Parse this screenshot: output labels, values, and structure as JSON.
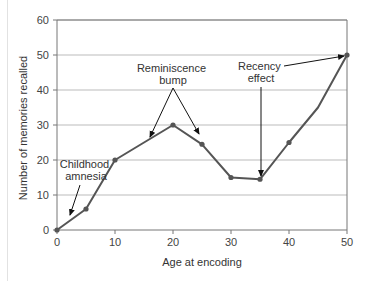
{
  "chart_data": {
    "type": "line",
    "title": "",
    "xlabel": "Age at encoding",
    "ylabel": "Number of memories recalled",
    "x": [
      0,
      5,
      10,
      15,
      20,
      25,
      30,
      35,
      40,
      45,
      50
    ],
    "series": [
      {
        "name": "Memories recalled",
        "values": [
          0,
          6,
          20,
          25,
          30,
          24.5,
          15,
          14.5,
          25,
          35,
          50
        ],
        "markers_at": [
          0,
          5,
          10,
          20,
          25,
          30,
          35,
          40,
          50
        ]
      }
    ],
    "xlim": [
      0,
      50
    ],
    "ylim": [
      0,
      60
    ],
    "xticks": [
      0,
      10,
      20,
      30,
      40,
      50
    ],
    "yticks": [
      0,
      10,
      20,
      30,
      40,
      50,
      60
    ],
    "grid": "horizontal",
    "legend": "none",
    "annotations": [
      {
        "text": [
          "Childhood",
          "amnesia"
        ],
        "points_to": [
          [
            2,
            2
          ]
        ]
      },
      {
        "text": [
          "Reminiscence",
          "bump"
        ],
        "points_to": [
          [
            15,
            25
          ],
          [
            25,
            24.5
          ]
        ]
      },
      {
        "text": [
          "Recency",
          "effect"
        ],
        "points_to": [
          [
            50,
            50
          ],
          [
            35,
            14.5
          ]
        ]
      }
    ]
  },
  "colors": {
    "line": "#555555",
    "marker": "#555555",
    "grid": "#bbbbbb",
    "axis": "#777777",
    "arrow": "#111111",
    "text": "#333333"
  }
}
